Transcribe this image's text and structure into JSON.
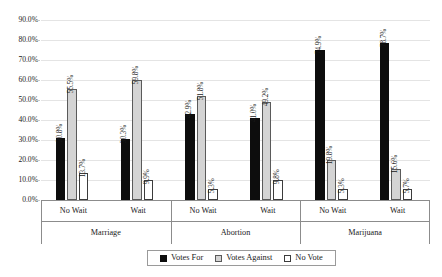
{
  "chart_data": {
    "type": "bar",
    "title": "",
    "subtitle": "",
    "xlabel": "",
    "ylabel": "",
    "ylim": [
      0,
      90
    ],
    "ytick_labels": [
      "0.0%",
      "10.0%",
      "20.0%",
      "30.0%",
      "40.0%",
      "50.0%",
      "60.0%",
      "70.0%",
      "80.0%",
      "90.0%"
    ],
    "ytick_values": [
      0,
      10,
      20,
      30,
      40,
      50,
      60,
      70,
      80,
      90
    ],
    "grid": "horizontal",
    "legend_position": "bottom",
    "group_labels": [
      "Marriage",
      "Abortion",
      "Marijuana"
    ],
    "subgroup_labels": [
      "No Wait",
      "Wait"
    ],
    "categories": [
      "Marriage / No Wait",
      "Marriage / Wait",
      "Abortion / No Wait",
      "Abortion / Wait",
      "Marijuana / No Wait",
      "Marijuana / Wait"
    ],
    "series": [
      {
        "name": "Votes For",
        "color": "#0d0d0d",
        "values": [
          30.8,
          30.3,
          42.9,
          41.0,
          74.9,
          78.7
        ],
        "labels": [
          "30.8%",
          "30.3%",
          "42.9%",
          "41.0%",
          "74.9%",
          "78.7%"
        ]
      },
      {
        "name": "Votes Against",
        "color": "#d4d4d4",
        "values": [
          55.5,
          59.8,
          51.8,
          49.2,
          19.8,
          15.6
        ],
        "labels": [
          "55.5%",
          "59.8%",
          "51.8%",
          "49.2%",
          "19.8%",
          "15.6%"
        ]
      },
      {
        "name": "No Vote",
        "color": "#ffffff",
        "values": [
          13.7,
          9.9,
          5.3,
          9.8,
          5.3,
          5.7
        ],
        "labels": [
          "13.7%",
          "9.9%",
          "5.3%",
          "9.8%",
          "5.3%",
          "5.7%"
        ]
      }
    ]
  },
  "legend": {
    "items": [
      {
        "label": "Votes For"
      },
      {
        "label": "Votes Against"
      },
      {
        "label": "No Vote"
      }
    ]
  }
}
